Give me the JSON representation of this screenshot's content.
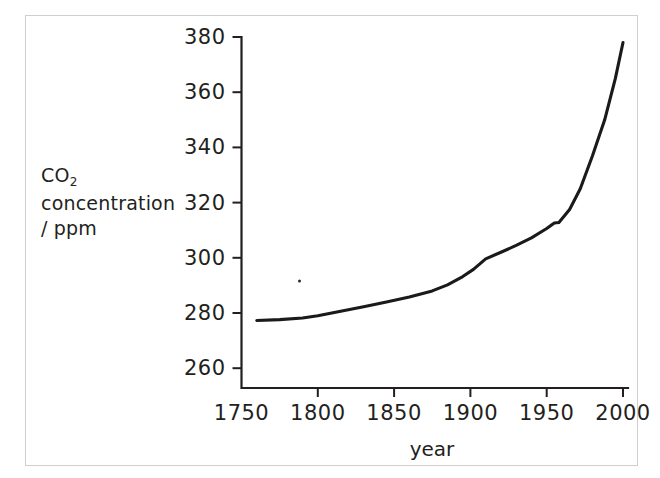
{
  "figure": {
    "y_axis_caption_lines": [
      "CO",
      "concentration",
      "/ ppm"
    ],
    "y_axis_subscript": "2",
    "line_color": "#1a1a1a",
    "axis_color": "#231f20",
    "frame_color": "#cfcfcf",
    "background": "#ffffff"
  },
  "chart_data": {
    "type": "line",
    "title": "",
    "xlabel": "year",
    "ylabel": "CO2 concentration / ppm",
    "xlim": [
      1750,
      2000
    ],
    "ylim": [
      252,
      380
    ],
    "xticks": [
      1750,
      1800,
      1850,
      1900,
      1950,
      2000
    ],
    "yticks": [
      260,
      280,
      300,
      320,
      340,
      360,
      380
    ],
    "xtick_labels": [
      "1750",
      "1800",
      "1850",
      "1900",
      "1950",
      "2000"
    ],
    "ytick_labels": [
      "260",
      "280",
      "300",
      "320",
      "340",
      "360",
      "380"
    ],
    "grid": false,
    "legend": null,
    "series": [
      {
        "name": "CO2 concentration",
        "x": [
          1760,
          1775,
          1790,
          1800,
          1815,
          1830,
          1845,
          1860,
          1875,
          1885,
          1895,
          1902,
          1910,
          1920,
          1930,
          1940,
          1950,
          1955,
          1958,
          1965,
          1972,
          1980,
          1988,
          1995,
          2000
        ],
        "y": [
          277.3,
          277.6,
          278.2,
          279.0,
          280.6,
          282.3,
          284.0,
          285.8,
          288.0,
          290.2,
          293.2,
          295.8,
          299.6,
          302.0,
          304.5,
          307.2,
          310.6,
          312.6,
          312.8,
          317.5,
          325.0,
          337.0,
          350.0,
          365.0,
          378.0
        ]
      }
    ],
    "annotations": [
      {
        "type": "speck",
        "x": 1788,
        "y": 291.6,
        "note": "small scan artifact dot"
      }
    ]
  }
}
